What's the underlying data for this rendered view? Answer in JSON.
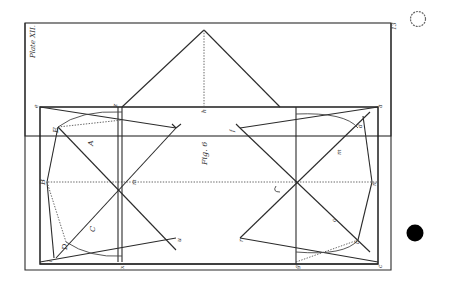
{
  "plate": {
    "title": "Plate XII.",
    "figure_caption": "Fig. 6",
    "corner_number": "13",
    "orientation": "rotated 90° counter-clockwise"
  },
  "labels": {
    "A": "A",
    "B": "B",
    "C": "C",
    "D": "D",
    "E": "E",
    "m": "m",
    "n": "n",
    "o": "o",
    "z": "z",
    "h": "h",
    "r": "r",
    "u": "u",
    "f": "f",
    "b": "b",
    "d": "d",
    "a": "a",
    "c": "c",
    "e": "e",
    "l": "l",
    "g": "g",
    "x": "x",
    "v": "v"
  },
  "margin_marks": {
    "hole_punch_open": "open circle",
    "hole_punch_filled": "filled circle"
  },
  "colors": {
    "ink": "#2b2b2b",
    "paper": "#ffffff"
  }
}
